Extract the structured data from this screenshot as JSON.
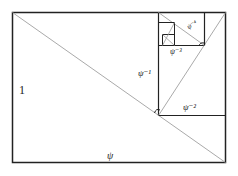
{
  "diagram": {
    "labels": {
      "one": "1",
      "psi": "ψ",
      "psi_m1": "ψ⁻¹",
      "psi_m2": "ψ⁻²",
      "psi_m3": "ψ⁻³",
      "psi_m4": "ψ⁻⁴"
    },
    "colors": {
      "frame": "#222222",
      "diagonal": "#aaaaaa"
    }
  }
}
